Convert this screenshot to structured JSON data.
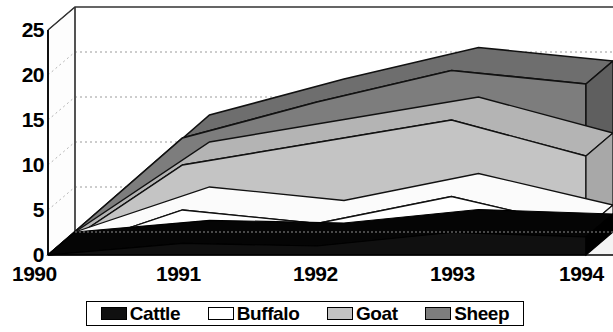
{
  "chart_data": {
    "type": "area",
    "title": "",
    "xlabel": "",
    "ylabel": "",
    "stacked": true,
    "three_d": true,
    "grid": true,
    "legend_position": "bottom",
    "categories": [
      "1990",
      "1991",
      "1992",
      "1993",
      "1994"
    ],
    "ylim": [
      0,
      25
    ],
    "yticks": [
      0,
      5,
      10,
      15,
      20,
      25
    ],
    "series": [
      {
        "name": "Cattle",
        "color": "#101010",
        "values": [
          0,
          1.3,
          1.0,
          2.5,
          2.0
        ]
      },
      {
        "name": "Buffalo",
        "color": "#ffffff",
        "values": [
          0,
          3.7,
          2.5,
          4.0,
          1.0
        ]
      },
      {
        "name": "Goat",
        "color": "#c4c4c4",
        "values": [
          0,
          5.0,
          9.0,
          8.5,
          8.0
        ]
      },
      {
        "name": "Sheep",
        "color": "#7d7d7d",
        "values": [
          0,
          3.0,
          4.5,
          5.5,
          8.0
        ]
      }
    ],
    "cumulative_tops": {
      "Cattle": [
        0,
        1.3,
        1.0,
        2.5,
        2.0
      ],
      "Buffalo": [
        0,
        5.0,
        3.5,
        6.5,
        3.0
      ],
      "Goat": [
        0,
        10.0,
        12.5,
        15.0,
        11.0
      ],
      "Sheep": [
        0,
        13.0,
        17.0,
        20.5,
        19.0
      ]
    }
  },
  "axis": {
    "y_ticks": [
      "25",
      "20",
      "15",
      "10",
      "5",
      "0"
    ],
    "x_ticks": [
      "1990",
      "1991",
      "1992",
      "1993",
      "1994"
    ]
  },
  "legend": {
    "items": [
      {
        "label": "Cattle",
        "color": "#101010"
      },
      {
        "label": "Buffalo",
        "color": "#ffffff"
      },
      {
        "label": "Goat",
        "color": "#c4c4c4"
      },
      {
        "label": "Sheep",
        "color": "#7d7d7d"
      }
    ]
  },
  "colors": {
    "cattle": "#101010",
    "buffalo": "#ffffff",
    "goat": "#c4c4c4",
    "sheep": "#7d7d7d",
    "grid": "#aaaaaa",
    "axis": "#000000",
    "wall": "#ffffff",
    "wall_side": "#fdfdfd",
    "floor": "#f2f2f2"
  }
}
